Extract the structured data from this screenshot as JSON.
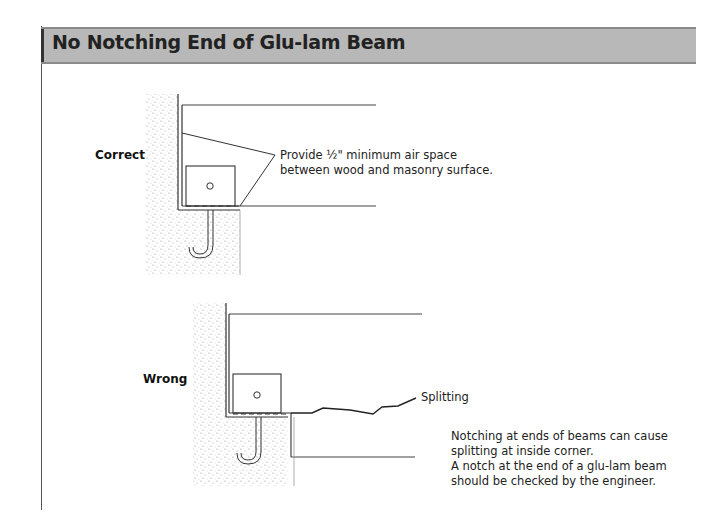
{
  "header": {
    "title": "No Notching End of Glu-lam Beam"
  },
  "diagrams": {
    "correct": {
      "label": "Correct",
      "note_lines": [
        "Provide ½\" minimum air space",
        "between wood and masonry surface."
      ]
    },
    "wrong": {
      "label": "Wrong",
      "callout": "Splitting",
      "note_lines": [
        "Notching at ends of beams can cause",
        "splitting at inside corner.",
        "A notch at the end of a glu-lam beam",
        "should be checked by the engineer."
      ]
    }
  },
  "colors": {
    "header_band": "#b8b8b8",
    "line": "#333333",
    "masonry_stipple": "#9a9a9a"
  }
}
